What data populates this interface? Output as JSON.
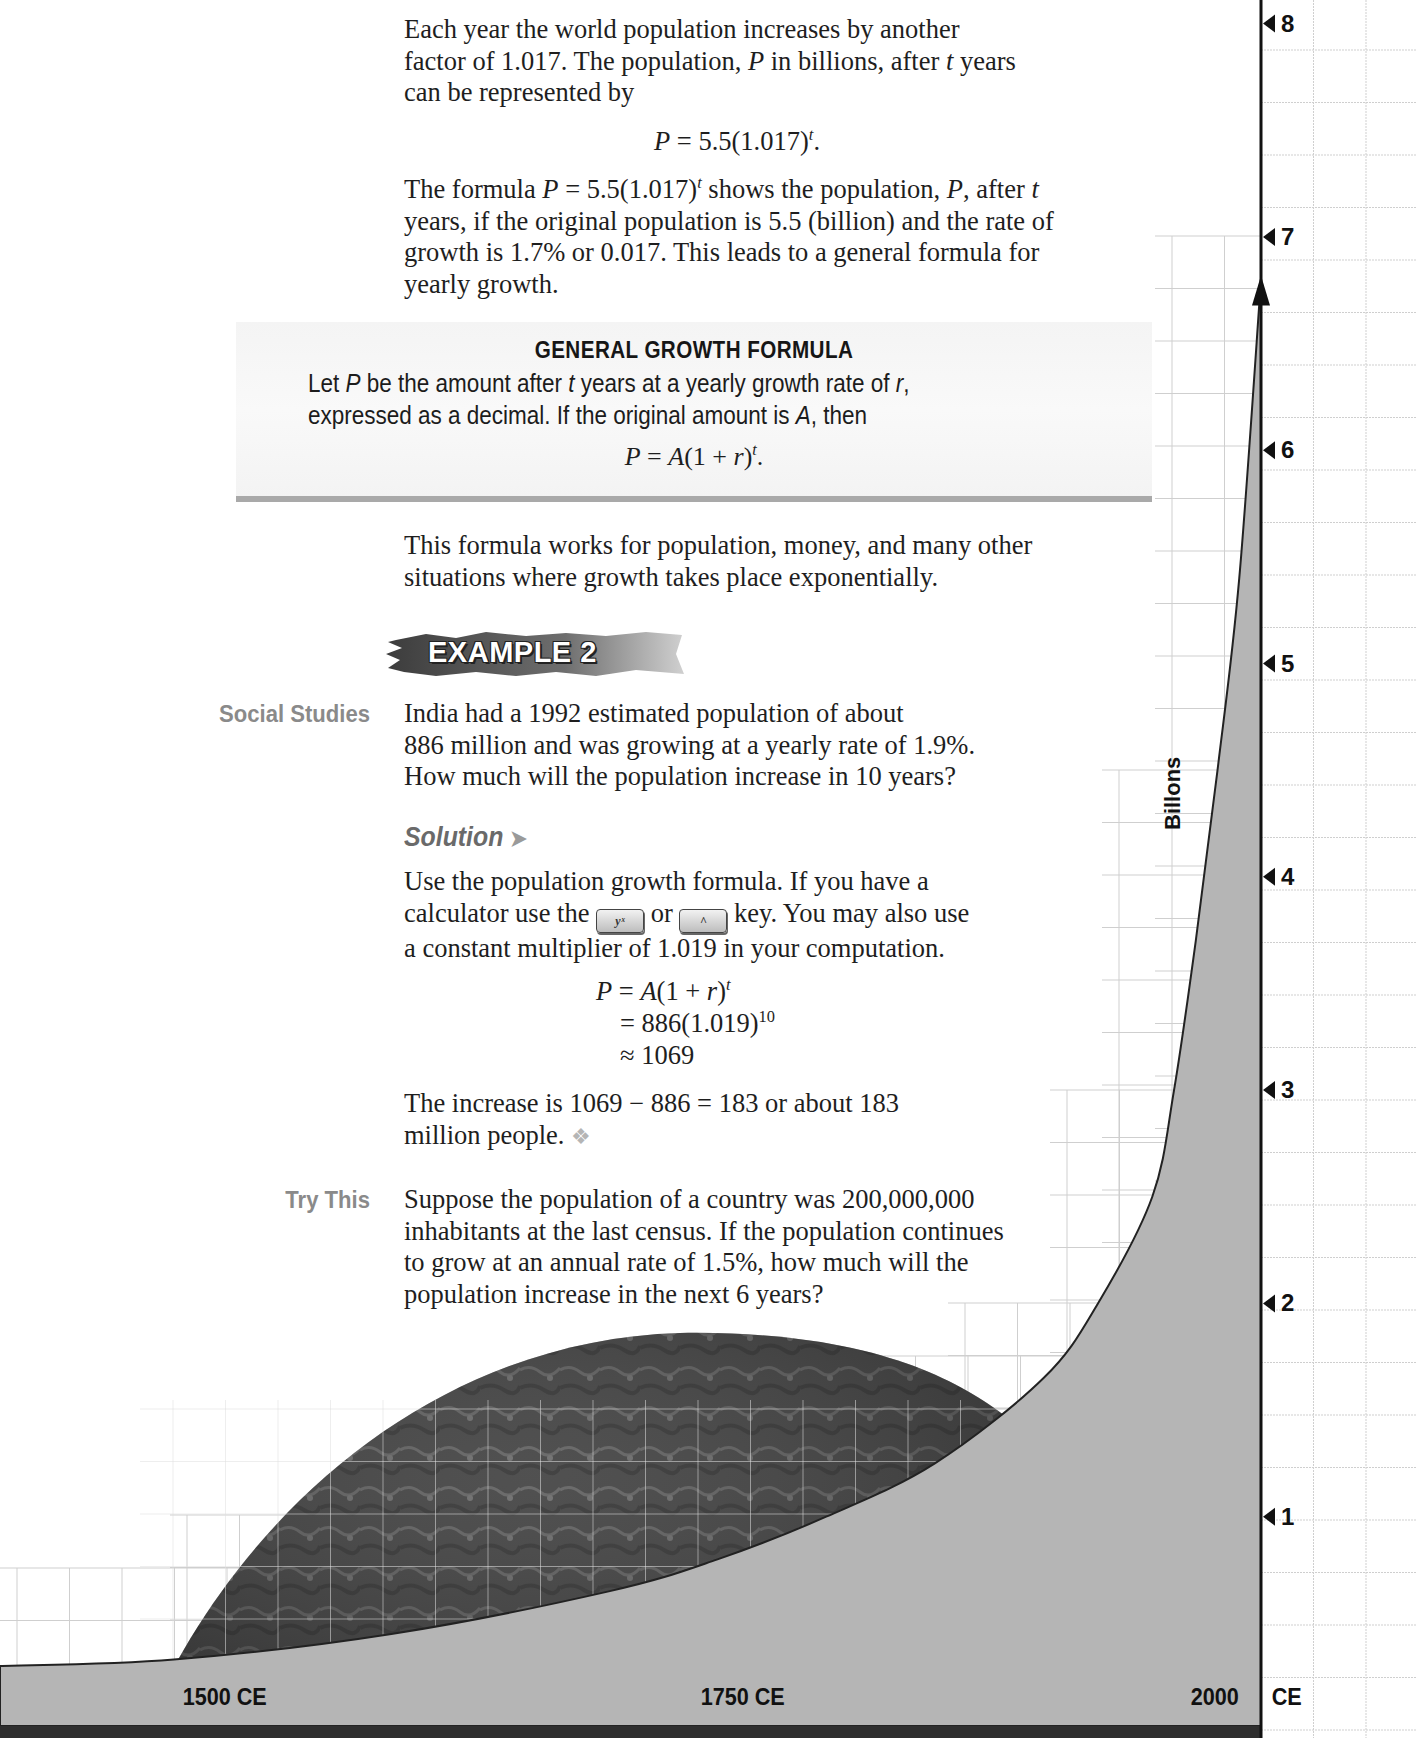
{
  "intro": {
    "p1_line1": "Each year the world population increases by another",
    "p1_line2a": "factor of 1.017. The population, ",
    "p1_var_P": "P",
    "p1_line2b": " in billions, after ",
    "p1_var_t": "t",
    "p1_line2c": " years",
    "p1_line3": "can be represented by",
    "eq1_lhs": "P",
    "eq1_rhs": " = 5.5(1.017)",
    "eq1_exp": "t",
    "eq1_end": ".",
    "p2_line1a": "The formula ",
    "p2_P": "P",
    "p2_line1b": " = 5.5(1.017)",
    "p2_exp": "t",
    "p2_line1c": " shows the population, ",
    "p2_P2": "P",
    "p2_line1d": ", after ",
    "p2_t": "t",
    "p2_line2": "years, if the original population is 5.5 (billion) and the rate of",
    "p2_line3": "growth is 1.7% or 0.017. This leads to a general formula for",
    "p2_line4": "yearly growth."
  },
  "formula_box": {
    "title": "GENERAL  GROWTH  FORMULA",
    "l1a": "Let ",
    "l1_P": "P",
    "l1b": " be the amount after ",
    "l1_t": "t",
    "l1c": " years at a yearly growth rate of ",
    "l1_r": "r",
    "l1d": ",",
    "l2a": "expressed as a decimal. If the original amount is ",
    "l2_A": "A",
    "l2b": ", then",
    "eq_P": "P",
    "eq_mid": " = ",
    "eq_A": "A",
    "eq_paren": "(1 + ",
    "eq_r": "r",
    "eq_close": ")",
    "eq_exp": "t",
    "eq_end": "."
  },
  "after_box": {
    "line1": "This formula works for population, money, and many other",
    "line2": "situations where growth takes place exponentially."
  },
  "example": {
    "banner": "EXAMPLE 2",
    "side_label": "Social Studies",
    "line1": "India had a 1992 estimated population of about",
    "line2": "886 million and was growing at a yearly rate of 1.9%.",
    "line3": "How much will the population increase in 10 years?"
  },
  "solution": {
    "heading": "Solution",
    "arrow": "➤",
    "line1": "Use the population growth formula. If you have a",
    "line2a": "calculator use the ",
    "key1": "yˣ",
    "line2b": " or ",
    "key2": "^",
    "line2c": " key. You may also use",
    "line3": "a constant multiplier of 1.019 in your computation.",
    "eq_l1_P": "P",
    "eq_l1_rest": " = ",
    "eq_l1_A": "A",
    "eq_l1_paren": "(1 + ",
    "eq_l1_r": "r",
    "eq_l1_close": ")",
    "eq_l1_exp": "t",
    "eq_l2": "= 886(1.019)",
    "eq_l2_exp": "10",
    "eq_l3": "≈ 1069",
    "result_line1": "The increase is 1069 − 886 = 183 or about 183",
    "result_line2": "million people. ",
    "end_mark": "❖"
  },
  "try_this": {
    "side_label": "Try This",
    "line1": "Suppose the population of a country was 200,000,000",
    "line2": "inhabitants at the last census. If the population continues",
    "line3": "to grow at an annual rate of 1.5%, how much will the",
    "line4": "population increase in the next 6 years?"
  },
  "chart_data": {
    "type": "area",
    "title": "",
    "xlabel": "",
    "ylabel": "Billons",
    "x_tick_labels": [
      "1500",
      "1750",
      "2000"
    ],
    "x_unit_label": "CE",
    "y_tick_labels": [
      "1",
      "2",
      "3",
      "4",
      "5",
      "6",
      "7",
      "8"
    ],
    "ylim": [
      0,
      8.5
    ],
    "xlim": [
      1420,
      2000
    ],
    "grid": true,
    "series": [
      {
        "name": "World population (billions)",
        "x": [
          1420,
          1500,
          1600,
          1700,
          1750,
          1800,
          1850,
          1900,
          1925,
          1950,
          1960,
          1970,
          1980,
          1990,
          2000
        ],
        "y": [
          0.3,
          0.33,
          0.45,
          0.65,
          0.8,
          1.0,
          1.25,
          1.65,
          2.0,
          2.5,
          3.0,
          3.7,
          4.5,
          5.4,
          6.8
        ]
      }
    ],
    "colors": {
      "fill": "#b5b5b5",
      "axis": "#111111",
      "grid": "#cfcfcf"
    }
  }
}
